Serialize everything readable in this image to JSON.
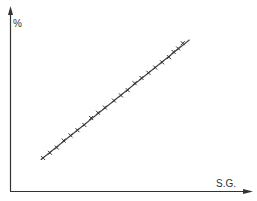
{
  "chart_data": {
    "type": "scatter",
    "title": "",
    "xlabel": "S.G.",
    "ylabel": "%",
    "grid": false,
    "legend": null,
    "ticks": {
      "x": [],
      "y": []
    },
    "xlim": [
      0,
      100
    ],
    "ylim": [
      0,
      100
    ],
    "trend_line": {
      "x0": 13,
      "y0": 18,
      "x1": 78,
      "y1": 87
    },
    "series": [
      {
        "name": "observations",
        "marker": "x",
        "x": [
          14,
          17,
          20,
          23,
          26,
          29,
          32,
          35,
          38,
          41,
          45,
          48,
          51,
          54,
          57,
          60,
          63,
          66,
          69,
          71,
          73,
          75
        ],
        "y": [
          19,
          22,
          25,
          29,
          32,
          35,
          38,
          42,
          45,
          48,
          52,
          55,
          58,
          62,
          65,
          68,
          71,
          74,
          77,
          80,
          82,
          85
        ]
      }
    ]
  },
  "labels": {
    "x_axis": "S.G.",
    "y_axis": "%"
  },
  "colors": {
    "ink": "#333333",
    "background": "#ffffff"
  }
}
